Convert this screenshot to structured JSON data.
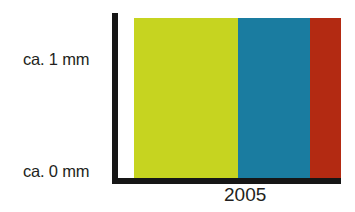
{
  "chart_data": {
    "type": "bar",
    "title": "",
    "subtitle": "",
    "xlabel": "",
    "ylabel": "",
    "orientation": "stacked-horizontal-single-bar",
    "categories": [
      "2005"
    ],
    "x_tick_labels": [
      "2005"
    ],
    "y_tick_labels": [
      "ca. 1 mm",
      "ca. 0 mm"
    ],
    "ylim": [
      0,
      1
    ],
    "ylim_unit": "mm",
    "grid": false,
    "legend": false,
    "legend_position": "none",
    "series": [
      {
        "name": "layer-1",
        "values": [
          50
        ],
        "color": "#c6d420"
      },
      {
        "name": "layer-2",
        "values": [
          35
        ],
        "color": "#1a7ca0"
      },
      {
        "name": "layer-3",
        "values": [
          15
        ],
        "color": "#b32a12"
      }
    ],
    "stack_total": 100,
    "value_unit": "percent-of-width"
  },
  "axes": {
    "y_label_top": "ca. 1 mm",
    "y_label_bottom": "ca. 0 mm",
    "x_label": "2005",
    "axis_color": "#161616"
  },
  "colors": {
    "background": "#ffffff",
    "axis": "#161616",
    "text": "#231f20",
    "segment_green": "#c6d420",
    "segment_blue": "#1a7ca0",
    "segment_red": "#b32a12"
  }
}
